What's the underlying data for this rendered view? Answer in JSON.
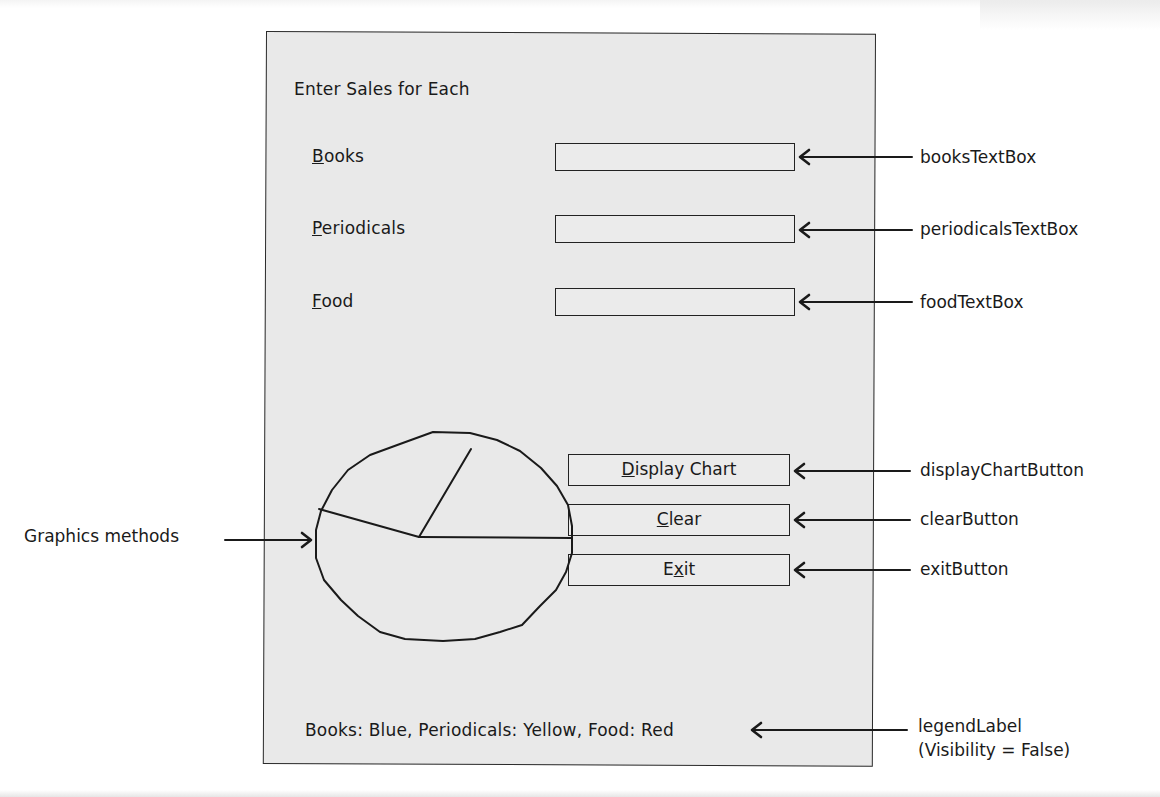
{
  "form": {
    "heading": "Enter Sales for Each",
    "fields": [
      {
        "label": "Books",
        "access_key": "B",
        "rest": "ooks",
        "value": ""
      },
      {
        "label": "Periodicals",
        "access_key": "P",
        "rest": "eriodicals",
        "value": ""
      },
      {
        "label": "Food",
        "access_key": "F",
        "rest": "ood",
        "value": ""
      }
    ],
    "buttons": [
      {
        "label": "Display Chart",
        "pre": "",
        "key": "D",
        "post": "isplay Chart"
      },
      {
        "label": "Clear",
        "pre": "",
        "key": "C",
        "post": "lear"
      },
      {
        "label": "Exit",
        "pre": "E",
        "key": "x",
        "post": "it"
      }
    ],
    "legend_label": "Books: Blue,  Periodicals: Yellow,  Food: Red"
  },
  "callouts": {
    "books_textbox": "booksTextBox",
    "periodicals_textbox": "periodicalsTextBox",
    "food_textbox": "foodTextBox",
    "display_chart_button": "displayChartButton",
    "clear_button": "clearButton",
    "exit_button": "exitButton",
    "legend_label": "legendLabel",
    "legend_label_note": "(Visibility = False)",
    "graphics_methods": "Graphics methods"
  },
  "pie_sketch": {
    "description": "Pie chart drawn with graphics methods, 3 slices",
    "slices": [
      "Books",
      "Periodicals",
      "Food"
    ],
    "legend_colors": {
      "Books": "Blue",
      "Periodicals": "Yellow",
      "Food": "Red"
    }
  }
}
